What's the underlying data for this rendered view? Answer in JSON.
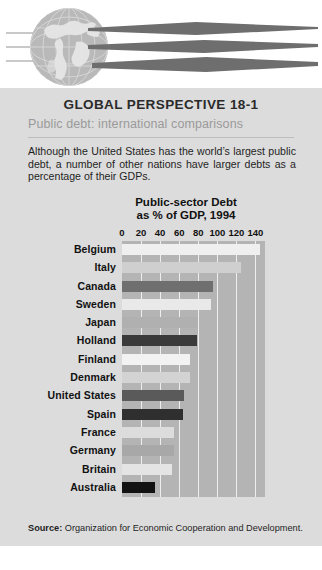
{
  "header": {
    "logo_name": "globe-logo",
    "bands": [
      "band-top",
      "band-middle",
      "band-bottom"
    ]
  },
  "panel": {
    "title": "GLOBAL PERSPECTIVE 18-1",
    "subtitle": "Public debt: international comparisons",
    "body": "Although the United States has the world’s largest public debt, a number of other nations have larger debts as a percentage of their GDPs.",
    "source_label": "Source:",
    "source_text": "Organization for Economic Cooperation and Development."
  },
  "colors": {
    "panel_bg": "#dcdcdc",
    "plot_bg": "#b4b4b4",
    "gridline": "#eeeeee",
    "text": "#1f1f1f",
    "subtitle": "#9a9a9a",
    "globe": "#b9b9b9"
  },
  "chart_data": {
    "type": "bar",
    "orientation": "horizontal",
    "title": "Public-sector Debt\nas % of GDP, 1994",
    "title_line1": "Public-sector Debt",
    "title_line2": "as % of GDP, 1994",
    "xlabel": "",
    "ylabel": "",
    "xlim": [
      0,
      150
    ],
    "ticks": [
      0,
      20,
      40,
      60,
      80,
      100,
      120,
      140
    ],
    "grid": true,
    "legend": "none",
    "categories": [
      "Belgium",
      "Italy",
      "Canada",
      "Sweden",
      "Japan",
      "Holland",
      "Finland",
      "Denmark",
      "United States",
      "Spain",
      "France",
      "Germany",
      "Britain",
      "Australia"
    ],
    "values": [
      145,
      125,
      95,
      93,
      80,
      79,
      71,
      71,
      65,
      64,
      55,
      55,
      52,
      35
    ],
    "bar_colors": [
      "#efefef",
      "#cfcfcf",
      "#6f6f6f",
      "#e9e9e9",
      "#b0b0b0",
      "#3a3a3a",
      "#f2f2f2",
      "#d3d3d3",
      "#5a5a5a",
      "#2f2f2f",
      "#dcdcdc",
      "#a8a8a8",
      "#e4e4e4",
      "#121212"
    ]
  }
}
